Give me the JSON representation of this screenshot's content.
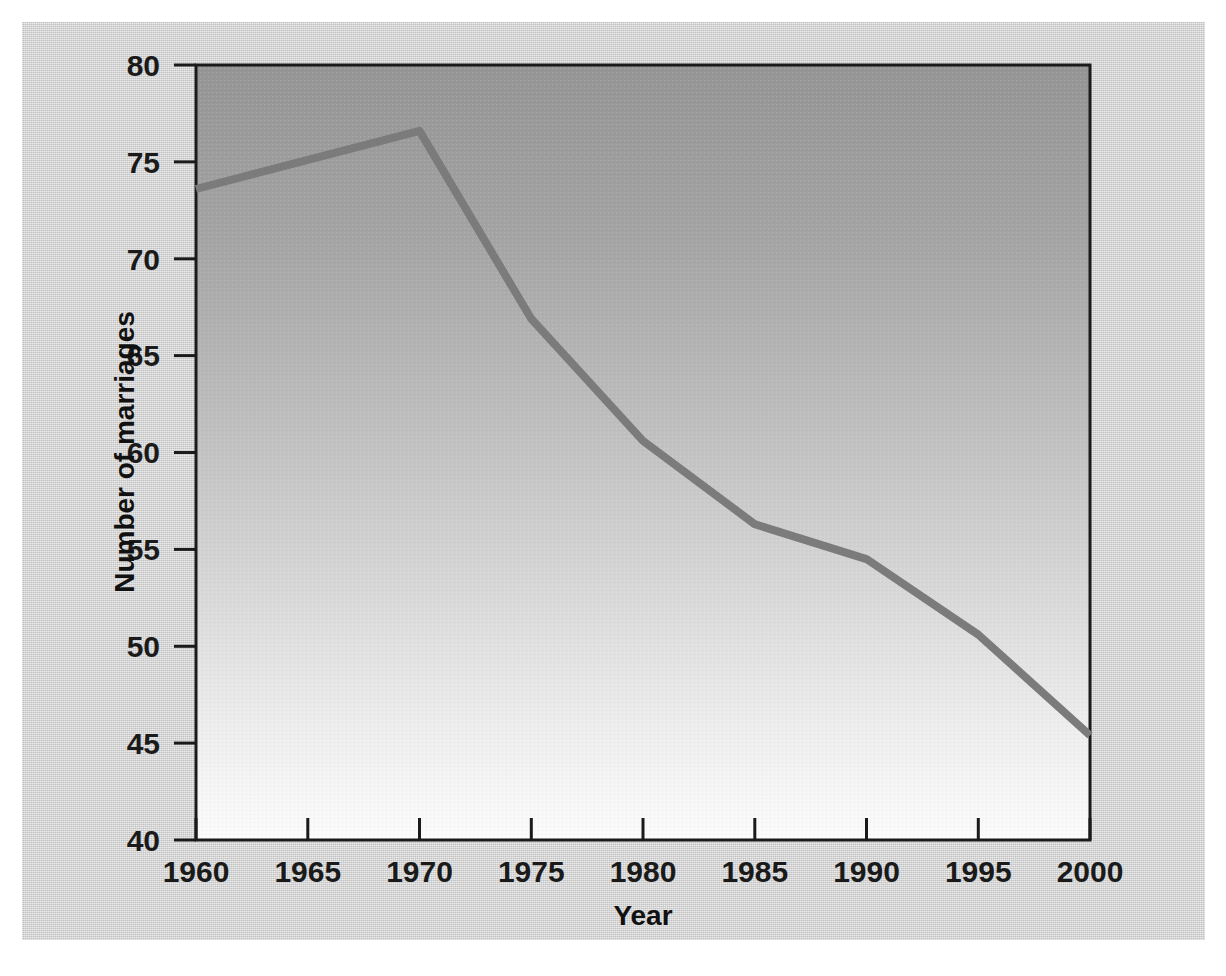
{
  "chart_data": {
    "type": "line",
    "title": "",
    "xlabel": "Year",
    "ylabel": "Number of marriages",
    "xlim": [
      1960,
      2000
    ],
    "ylim": [
      40,
      80
    ],
    "grid": false,
    "legend": null,
    "x": [
      1960,
      1970,
      1975,
      1980,
      1985,
      1990,
      1995,
      2000
    ],
    "values": [
      73.6,
      76.6,
      66.9,
      60.6,
      56.3,
      54.5,
      50.6,
      45.4
    ],
    "series": [
      {
        "name": "Number of marriages",
        "x": [
          1960,
          1970,
          1975,
          1980,
          1985,
          1990,
          1995,
          2000
        ],
        "values": [
          73.6,
          76.6,
          66.9,
          60.6,
          56.3,
          54.5,
          50.6,
          45.4
        ]
      }
    ],
    "x_tick_labels": [
      "1960",
      "1965",
      "1970",
      "1975",
      "1980",
      "1985",
      "1990",
      "1995",
      "2000"
    ],
    "x_tick_values": [
      1960,
      1965,
      1970,
      1975,
      1980,
      1985,
      1990,
      1995,
      2000
    ],
    "y_tick_labels": [
      "40",
      "45",
      "50",
      "55",
      "60",
      "65",
      "70",
      "75",
      "80"
    ],
    "y_tick_values": [
      40,
      45,
      50,
      55,
      60,
      65,
      70,
      75,
      80
    ],
    "colors": {
      "line": "#7b7b7b",
      "axis": "#1a1a1a",
      "plot_background_top": "#999999",
      "plot_background_bottom": "#f7f7f7",
      "figure_background": "#cfcfcf",
      "text": "#1a1a1a"
    }
  }
}
